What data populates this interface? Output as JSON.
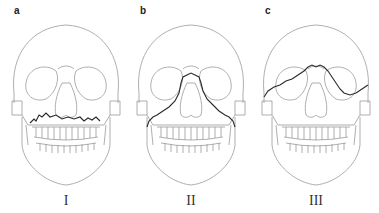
{
  "figure": {
    "panels": [
      {
        "letter": "a",
        "numeral": "I",
        "fracture": "Le Fort I"
      },
      {
        "letter": "b",
        "numeral": "II",
        "fracture": "Le Fort II"
      },
      {
        "letter": "c",
        "numeral": "III",
        "fracture": "Le Fort III"
      }
    ]
  },
  "colors": {
    "outline": "#9a9a9a",
    "fracture_line": "#2a2a2a",
    "background": "#ffffff"
  }
}
